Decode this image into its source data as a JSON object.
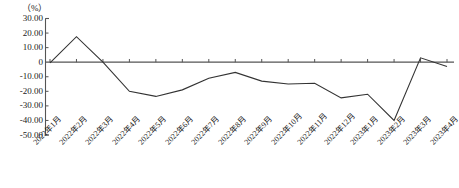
{
  "chart_data": {
    "type": "line",
    "title": "",
    "subtitle": "",
    "unit_label": "（%）",
    "xlabel": "",
    "ylabel": "",
    "ylim": [
      -50,
      30
    ],
    "ytick_values": [
      30,
      20,
      10,
      0,
      -10,
      -20,
      -30,
      -40,
      -50
    ],
    "ytick_labels": [
      "30.00",
      "20.00",
      "10.00",
      "0",
      "-10.00",
      "-20.00",
      "-30.00",
      "-40.00",
      "-50.00"
    ],
    "grid": false,
    "legend": null,
    "legend_position": "none",
    "line_color": "#333333",
    "axis_color": "#555555",
    "categories": [
      "2022年1月",
      "2022年2月",
      "2022年3月",
      "2022年4月",
      "2022年5月",
      "2022年6月",
      "2022年7月",
      "2022年8月",
      "2022年9月",
      "2022年10月",
      "2022年11月",
      "2022年12月",
      "2023年1月",
      "2023年2月",
      "2023年3月",
      "2023年4月"
    ],
    "values": [
      -0.5,
      17.5,
      0.0,
      -20.0,
      -23.5,
      -19.0,
      -11.0,
      -7.0,
      -13.0,
      -15.0,
      -14.5,
      -24.5,
      -22.0,
      -40.0,
      3.0,
      -3.0
    ]
  }
}
